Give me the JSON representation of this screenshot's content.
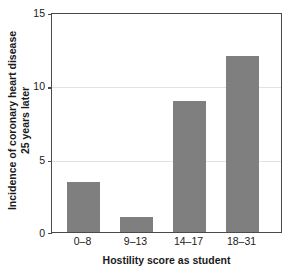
{
  "chart_data": {
    "type": "bar",
    "title": "",
    "categories": [
      "0–8",
      "9–13",
      "14–17",
      "18–31"
    ],
    "values": [
      3.4,
      1.0,
      8.9,
      12.0
    ],
    "series": [
      {
        "name": "Incidence of coronary heart disease 25 years later",
        "values": [
          3.4,
          1.0,
          8.9,
          12.0
        ]
      }
    ],
    "xlabel": "Hostility score as student",
    "ylabel_line1": "Incidence of coronary heart disease",
    "ylabel_line2": "25 years later",
    "ylim": [
      0,
      15
    ],
    "yticks": [
      0,
      5,
      10,
      15
    ],
    "ytick_labels": [
      "0",
      "5",
      "10",
      "15"
    ],
    "grid": "horizontal-at-5-and-10",
    "legend": "none",
    "bar_color": "#7f7f7f",
    "gridline_color": "#e2e2e2",
    "axis_color": "#4a4a4a",
    "text_color": "#1a1a1a",
    "background": "#ffffff"
  }
}
